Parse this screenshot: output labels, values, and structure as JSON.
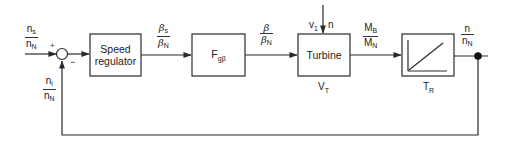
{
  "diagram": {
    "type": "control-loop-block-diagram",
    "blocks": [
      {
        "id": "speed_regulator",
        "label_line1": "Speed",
        "label_line2": "regulator"
      },
      {
        "id": "f_block",
        "label": "F",
        "label_sub": "gβ"
      },
      {
        "id": "turbine",
        "label": "Turbine",
        "below_label": "V",
        "below_sub": "T"
      },
      {
        "id": "integrator",
        "below_label": "T",
        "below_sub": "R",
        "icon": "ramp-icon"
      }
    ],
    "summing_junction": {
      "plus": "+",
      "minus": "−"
    },
    "signals": {
      "input": {
        "num": "n",
        "num_sub": "s",
        "den": "n",
        "den_sub": "N"
      },
      "feedback": {
        "num": "n",
        "num_sub": "i",
        "den": "n",
        "den_sub": "N"
      },
      "regulator_out": {
        "num": "β",
        "num_sub": "s",
        "den": "β",
        "den_sub": "N"
      },
      "f_out": {
        "num": "β",
        "den": "β",
        "den_sub": "N"
      },
      "turbine_out": {
        "num": "M",
        "num_sub": "B",
        "den": "M",
        "den_sub": "N"
      },
      "output": {
        "num": "n",
        "den": "n",
        "den_sub": "N"
      },
      "turbine_inputs": {
        "v": "v",
        "v_sub": "1",
        "n": "n"
      }
    },
    "colors": {
      "line": "#2a2a2a",
      "background": "#ffffff"
    }
  }
}
